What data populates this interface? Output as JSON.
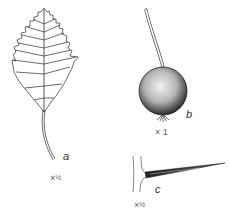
{
  "figure": {
    "panels": [
      {
        "id": "a",
        "label": "a",
        "subject": "leaf",
        "scale_prefix": "×",
        "scale_value": "½"
      },
      {
        "id": "b",
        "label": "b",
        "subject": "fruit",
        "scale_prefix": "×",
        "scale_value": "1"
      },
      {
        "id": "c",
        "label": "c",
        "subject": "thorn",
        "scale_prefix": "×",
        "scale_value": "½"
      }
    ]
  },
  "colors": {
    "ink": "#333333",
    "background": "#ffffff"
  }
}
